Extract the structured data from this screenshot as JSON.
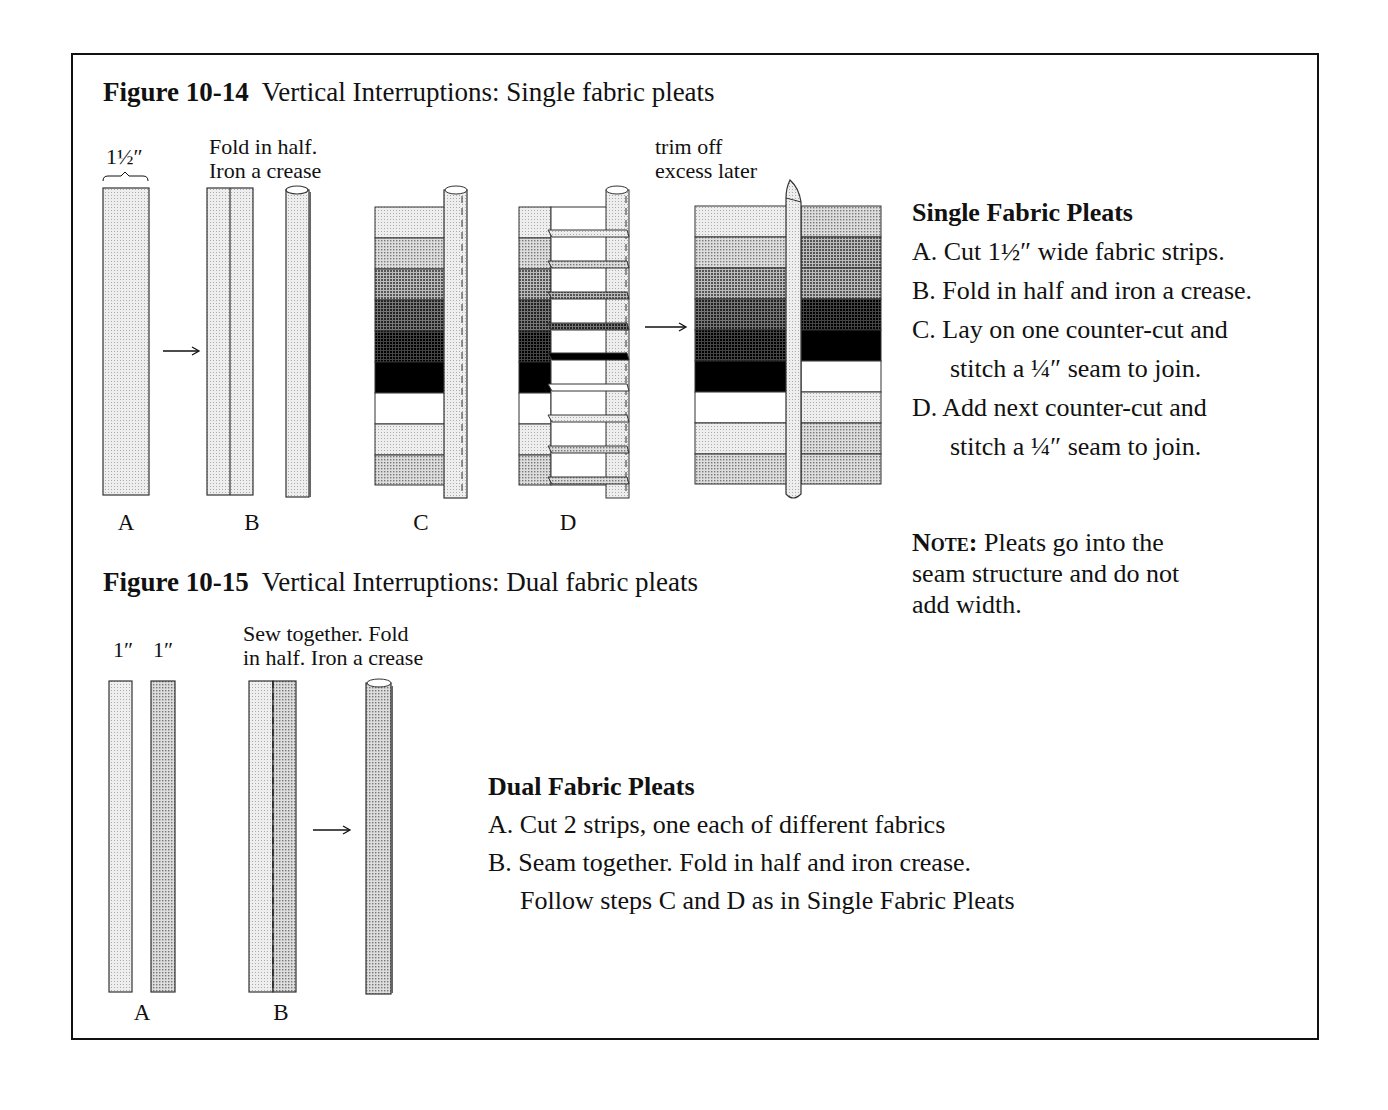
{
  "figure_14": {
    "number": "Figure 10-14",
    "caption": "Vertical Interruptions: Single fabric pleats",
    "width_label": "1½″",
    "fold_label_1": "Fold in half.",
    "fold_label_2": "Iron a crease",
    "trim_label_1": "trim off",
    "trim_label_2": "excess later",
    "step_labels": [
      "A",
      "B",
      "C",
      "D"
    ]
  },
  "single_instructions": {
    "heading": "Single Fabric Pleats",
    "lines": [
      "A. Cut 1½″ wide fabric strips.",
      "B. Fold in half and iron a crease.",
      "C. Lay on one counter-cut and",
      "stitch a ¼″ seam to join.",
      "D. Add next counter-cut and",
      "stitch a ¼″ seam to join."
    ]
  },
  "note": {
    "label": "Note:",
    "text_1": " Pleats go into the",
    "text_2": "seam structure and do not",
    "text_3": "add width."
  },
  "figure_15": {
    "number": "Figure 10-15",
    "caption": "Vertical Interruptions: Dual fabric pleats",
    "width_label_1": "1″",
    "width_label_2": "1″",
    "sew_label_1": "Sew together. Fold",
    "sew_label_2": "in half. Iron a crease",
    "step_labels": [
      "A",
      "B"
    ]
  },
  "dual_instructions": {
    "heading": "Dual Fabric Pleats",
    "lines": [
      "A. Cut 2 strips, one each of different fabrics",
      "B. Seam together. Fold in half and iron crease.",
      "Follow steps C and D as in Single Fabric Pleats"
    ]
  },
  "colors": {
    "ink": "#111111",
    "fabric_light": "#e2e2e2",
    "fabric_med": "#b8b8b8",
    "fabric_dark": "#6e6e6e",
    "fabric_black": "#000000"
  }
}
